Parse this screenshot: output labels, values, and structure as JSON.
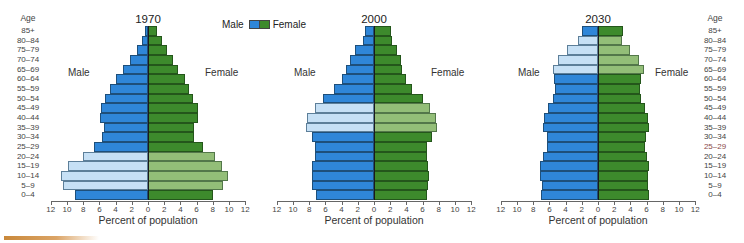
{
  "legend": {
    "male_label": "Male",
    "female_label": "Female",
    "male_color": "#2f86d8",
    "female_color": "#3d8a2c"
  },
  "age_axis": {
    "header": "Age",
    "groups": [
      "85+",
      "80–84",
      "75–79",
      "70–74",
      "65–69",
      "60–64",
      "55–59",
      "50–54",
      "45–49",
      "40–44",
      "35–39",
      "30–34",
      "25–29",
      "20–24",
      "15–19",
      "10–14",
      "5–9",
      "0–4"
    ]
  },
  "x_ticks": [
    "12",
    "10",
    "8",
    "6",
    "4",
    "2",
    "0",
    "2",
    "4",
    "6",
    "8",
    "10",
    "12"
  ],
  "chart_data": [
    {
      "type": "bar",
      "orientation": "horizontal-population-pyramid",
      "title": "1970",
      "xlabel": "Percent of population",
      "ylabel": "Age",
      "xlim": [
        -12,
        12
      ],
      "side_labels": {
        "left": "Male",
        "right": "Female"
      },
      "categories": [
        "85+",
        "80–84",
        "75–79",
        "70–74",
        "65–69",
        "60–64",
        "55–59",
        "50–54",
        "45–49",
        "40–44",
        "35–39",
        "30–34",
        "25–29",
        "20–24",
        "15–19",
        "10–14",
        "5–9",
        "0–4"
      ],
      "series": [
        {
          "name": "Male",
          "values": [
            0.4,
            0.7,
            1.4,
            2.2,
            3.1,
            4.0,
            4.7,
            5.3,
            5.8,
            5.9,
            5.4,
            5.7,
            6.7,
            8.0,
            9.9,
            10.7,
            10.5,
            9.0
          ]
        },
        {
          "name": "Female",
          "values": [
            1.1,
            1.7,
            2.3,
            3.1,
            3.7,
            4.6,
            5.1,
            5.6,
            6.2,
            6.2,
            5.7,
            5.7,
            6.8,
            8.3,
            9.1,
            9.9,
            9.3,
            8.0
          ]
        }
      ],
      "highlighted": [
        "20–24",
        "15–19",
        "10–14",
        "5–9"
      ]
    },
    {
      "type": "bar",
      "orientation": "horizontal-population-pyramid",
      "title": "2000",
      "xlabel": "Percent of population",
      "ylabel": "Age",
      "xlim": [
        -12,
        12
      ],
      "side_labels": {
        "left": "Male",
        "right": "Female"
      },
      "categories": [
        "85+",
        "80–84",
        "75–79",
        "70–74",
        "65–69",
        "60–64",
        "55–59",
        "50–54",
        "45–49",
        "40–44",
        "35–39",
        "30–34",
        "25–29",
        "20–24",
        "15–19",
        "10–14",
        "5–9",
        "0–4"
      ],
      "series": [
        {
          "name": "Male",
          "values": [
            1.1,
            1.4,
            2.3,
            3.0,
            3.4,
            4.0,
            4.9,
            6.3,
            7.3,
            8.3,
            8.4,
            7.7,
            7.3,
            7.3,
            7.6,
            7.7,
            7.7,
            7.2
          ]
        },
        {
          "name": "Female",
          "values": [
            2.1,
            2.2,
            2.9,
            3.3,
            3.5,
            3.9,
            4.7,
            6.1,
            6.9,
            7.7,
            7.8,
            7.2,
            6.6,
            6.6,
            6.7,
            6.8,
            6.7,
            6.5
          ]
        }
      ],
      "highlighted": [
        "45–49",
        "40–44",
        "35–39"
      ]
    },
    {
      "type": "bar",
      "orientation": "horizontal-population-pyramid",
      "title": "2030",
      "xlabel": "Percent of population",
      "ylabel": "Age",
      "xlim": [
        -12,
        12
      ],
      "side_labels": {
        "left": "Male",
        "right": "Female"
      },
      "categories": [
        "85+",
        "80–84",
        "75–79",
        "70–74",
        "65–69",
        "60–64",
        "55–59",
        "50–54",
        "45–49",
        "40–44",
        "35–39",
        "30–34",
        "25–29",
        "20–24",
        "15–19",
        "10–14",
        "5–9",
        "0–4"
      ],
      "series": [
        {
          "name": "Male",
          "values": [
            2.0,
            2.5,
            3.8,
            4.9,
            5.6,
            5.4,
            5.3,
            5.6,
            6.2,
            6.7,
            6.8,
            6.3,
            6.3,
            6.8,
            7.2,
            7.1,
            6.9,
            7.0
          ]
        },
        {
          "name": "Female",
          "values": [
            3.1,
            3.0,
            4.0,
            5.1,
            5.7,
            5.3,
            5.2,
            5.3,
            5.8,
            6.2,
            6.3,
            5.9,
            5.8,
            6.0,
            6.3,
            6.2,
            6.2,
            6.3
          ]
        }
      ],
      "highlighted": [
        "80–84",
        "75–79",
        "70–74",
        "65–69"
      ]
    }
  ]
}
